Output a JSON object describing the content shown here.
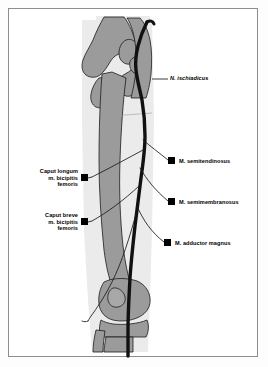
{
  "figure": {
    "colors": {
      "frame_border": "#8d8d8d",
      "background": "#ffffff",
      "bone_fill": "#9b9b9b",
      "limb_silhouette": "#ebebeb",
      "nerve": "#111111",
      "marker": "#000000",
      "leader_line": "#1a1a1a"
    }
  },
  "labels": {
    "nerve": {
      "text": "N. ischiadicus",
      "style": "italic",
      "side": "right"
    },
    "right_items": [
      {
        "text": "M. semitendinosus",
        "side": "right"
      },
      {
        "text": "M. semimembranosus",
        "side": "right"
      },
      {
        "text": "M. adductor magnus",
        "side": "right"
      }
    ],
    "left_items": [
      {
        "line1": "Caput longum",
        "line2": "m. bicipitis",
        "line3": "femoris",
        "side": "left"
      },
      {
        "line1": "Caput breve",
        "line2": "m. bicipitis",
        "line3": "femoris",
        "side": "left"
      }
    ]
  },
  "anatomy": {
    "bones": [
      "pelvis",
      "hip-joint",
      "femoral-head",
      "greater-trochanter",
      "femur-shaft",
      "femoral-condyles",
      "patella",
      "tibia",
      "fibula"
    ],
    "nerve_name": "N. ischiadicus",
    "branch_count": 5
  }
}
